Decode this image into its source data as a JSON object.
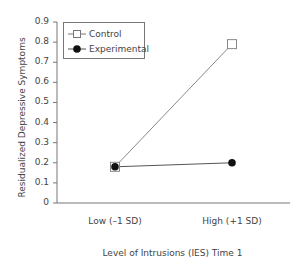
{
  "chart_data": {
    "type": "line",
    "title": "",
    "xlabel": "Level of Intrusions (IES) Time 1",
    "ylabel": "Residualized Depressive Symptoms",
    "categories": [
      "Low (–1 SD)",
      "High (+1 SD)"
    ],
    "series": [
      {
        "name": "Control",
        "marker": "open-square",
        "values": [
          0.18,
          0.79
        ]
      },
      {
        "name": "Experimental",
        "marker": "filled-circle",
        "values": [
          0.18,
          0.2
        ]
      }
    ],
    "ylim": [
      0,
      0.9
    ],
    "yticks": [
      "0",
      "0.1",
      "0.2",
      "0.3",
      "0.4",
      "0.5",
      "0.6",
      "0.7",
      "0.8",
      "0.9"
    ],
    "grid": false,
    "legend_position": "upper-left"
  },
  "legend": {
    "control_label": "Control",
    "experimental_label": "Experimental"
  },
  "colors": {
    "axis": "#777777",
    "control_line": "#888888",
    "experimental_line": "#555555",
    "experimental_marker": "#111111"
  }
}
